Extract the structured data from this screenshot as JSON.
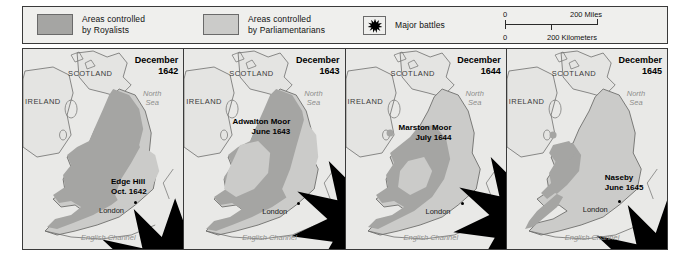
{
  "legend": {
    "royalists": {
      "label_line1": "Areas controlled",
      "label_line2": "by Royalists",
      "swatch_color": "#a5a5a3",
      "icon": "legend-swatch"
    },
    "parliamentarians": {
      "label_line1": "Areas controlled",
      "label_line2": "by Parliamentarians",
      "swatch_color": "#cbcbc9",
      "icon": "legend-swatch"
    },
    "battles": {
      "label": "Major battles",
      "icon": "starburst-icon"
    }
  },
  "scale_bar": {
    "miles_zero": "0",
    "miles_max": "200 Miles",
    "km_zero": "0",
    "km_max": "200 Kilometers"
  },
  "panels": [
    {
      "date_line1": "December",
      "date_line2": "1642",
      "scotland": "SCOTLAND",
      "ireland": "IRELAND",
      "sea_line1": "North",
      "sea_line2": "Sea",
      "channel": "English Channel",
      "city": "London",
      "battle_line1": "Edge Hill",
      "battle_line2": "Oct. 1642"
    },
    {
      "date_line1": "December",
      "date_line2": "1643",
      "scotland": "SCOTLAND",
      "ireland": "IRELAND",
      "sea_line1": "North",
      "sea_line2": "Sea",
      "channel": "English Channel",
      "city": "London",
      "battle_line1": "Adwalton Moor",
      "battle_line2": "June 1643"
    },
    {
      "date_line1": "December",
      "date_line2": "1644",
      "scotland": "SCOTLAND",
      "ireland": "IRELAND",
      "sea_line1": "North",
      "sea_line2": "Sea",
      "channel": "English Channel",
      "city": "London",
      "battle_line1": "Marston Moor",
      "battle_line2": "July 1644"
    },
    {
      "date_line1": "December",
      "date_line2": "1645",
      "scotland": "SCOTLAND",
      "ireland": "IRELAND",
      "sea_line1": "North",
      "sea_line2": "Sea",
      "channel": "English Channel",
      "city": "London",
      "battle_line1": "Naseby",
      "battle_line2": "June 1645"
    }
  ],
  "colors": {
    "royalist_fill": "#a5a5a3",
    "parliamentarian_fill": "#cbcbc9",
    "sea_background": "#e9e9e7",
    "land_outline": "#6f6f6d",
    "frame": "#3a3a3a"
  }
}
